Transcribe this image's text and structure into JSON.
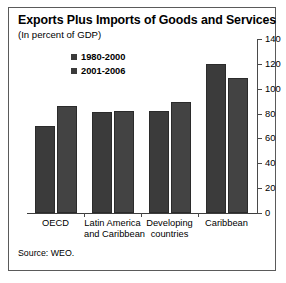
{
  "chart_data": {
    "type": "bar",
    "title": "Exports Plus Imports of Goods and Services",
    "subtitle": "(In percent of GDP)",
    "xlabel": "",
    "ylabel": "",
    "ylim": [
      0,
      140
    ],
    "yticks": [
      0,
      20,
      40,
      60,
      80,
      100,
      120,
      140
    ],
    "ytick_labels": [
      "0",
      "20",
      "40",
      "60",
      "80",
      "100",
      "120",
      "140"
    ],
    "y_axis_position": "right",
    "grid": false,
    "legend_position": "upper-center",
    "categories": [
      "OECD",
      "Latin America and Caribbean",
      "Developing countries",
      "Caribbean"
    ],
    "category_labels": [
      [
        "OECD"
      ],
      [
        "Latin America",
        "and Caribbean"
      ],
      [
        "Developing",
        "countries"
      ],
      [
        "Caribbean"
      ]
    ],
    "series": [
      {
        "name": "1980-2000",
        "color": "#3b3b3b",
        "values": [
          70,
          81,
          82,
          120
        ]
      },
      {
        "name": "2001-2006",
        "color": "#434343",
        "values": [
          86,
          82,
          89,
          109
        ]
      }
    ],
    "source": "Source: WEO."
  }
}
